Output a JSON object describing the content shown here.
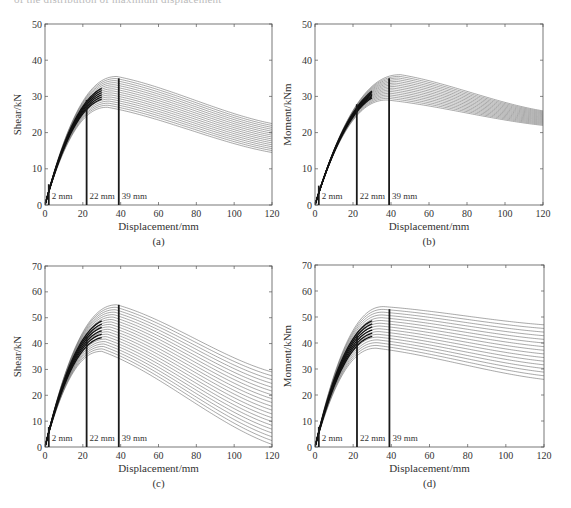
{
  "page": {
    "cut_off_caption": "of the distribution of maximum displacement"
  },
  "markers": {
    "positions": [
      2,
      22,
      39
    ],
    "labels": [
      "2 mm",
      "22 mm",
      "39 mm"
    ]
  },
  "chart_data": [
    {
      "id": "a",
      "type": "line",
      "subtype": "contour",
      "panel_label": "(a)",
      "title": "",
      "xlabel": "Displacement/mm",
      "ylabel": "Shear/kN",
      "xlim": [
        0,
        120
      ],
      "ylim": [
        0,
        50
      ],
      "xticks": [
        0,
        20,
        40,
        60,
        80,
        100,
        120
      ],
      "yticks": [
        0,
        10,
        20,
        30,
        40,
        50
      ],
      "grid": false,
      "legend": null,
      "vertical_markers": [
        {
          "x": 2,
          "label": "2 mm"
        },
        {
          "x": 22,
          "label": "22 mm"
        },
        {
          "x": 39,
          "label": "39 mm",
          "top": 35
        }
      ],
      "contour_band": {
        "peak_x": [
          33,
          38
        ],
        "peak_y": [
          27,
          35.5
        ],
        "end_y_at_120": [
          14.5,
          22.5
        ],
        "levels": 16
      }
    },
    {
      "id": "b",
      "type": "line",
      "subtype": "contour",
      "panel_label": "(b)",
      "title": "",
      "xlabel": "Displacement/mm",
      "ylabel": "Moment/kNm",
      "xlim": [
        0,
        120
      ],
      "ylim": [
        0,
        50
      ],
      "xticks": [
        0,
        20,
        40,
        60,
        80,
        100,
        120
      ],
      "yticks": [
        0,
        10,
        20,
        30,
        40,
        50
      ],
      "grid": false,
      "legend": null,
      "vertical_markers": [
        {
          "x": 2,
          "label": "2 mm"
        },
        {
          "x": 22,
          "label": "22 mm"
        },
        {
          "x": 39,
          "label": "39 mm",
          "top": 35
        }
      ],
      "contour_band": {
        "peak_x": [
          38,
          45
        ],
        "peak_y": [
          29,
          36
        ],
        "end_y_at_120": [
          22,
          26
        ],
        "levels": 16
      }
    },
    {
      "id": "c",
      "type": "line",
      "subtype": "contour",
      "panel_label": "(c)",
      "title": "",
      "xlabel": "Displacement/mm",
      "ylabel": "Shear/kN",
      "xlim": [
        0,
        120
      ],
      "ylim": [
        0,
        70
      ],
      "xticks": [
        0,
        20,
        40,
        60,
        80,
        100,
        120
      ],
      "yticks": [
        0,
        10,
        20,
        30,
        40,
        50,
        60,
        70
      ],
      "grid": false,
      "legend": null,
      "vertical_markers": [
        {
          "x": 2,
          "label": "2 mm"
        },
        {
          "x": 22,
          "label": "22 mm"
        },
        {
          "x": 39,
          "label": "39 mm",
          "top": 55
        }
      ],
      "contour_band": {
        "peak_x": [
          30,
          38
        ],
        "peak_y": [
          37,
          55
        ],
        "end_y_at_120": [
          1,
          29
        ],
        "levels": 20
      }
    },
    {
      "id": "d",
      "type": "line",
      "subtype": "contour",
      "panel_label": "(d)",
      "title": "",
      "xlabel": "Displacement/mm",
      "ylabel": "Moment/kNm",
      "xlim": [
        0,
        120
      ],
      "ylim": [
        0,
        70
      ],
      "xticks": [
        0,
        20,
        40,
        60,
        80,
        100,
        120
      ],
      "yticks": [
        0,
        10,
        20,
        30,
        40,
        50,
        60,
        70
      ],
      "grid": false,
      "legend": null,
      "vertical_markers": [
        {
          "x": 2,
          "label": "2 mm"
        },
        {
          "x": 22,
          "label": "22 mm"
        },
        {
          "x": 39,
          "label": "39 mm",
          "top": 53
        }
      ],
      "contour_band": {
        "peak_x": [
          32,
          36
        ],
        "peak_y": [
          38,
          54
        ],
        "end_y_at_120": [
          26,
          47
        ],
        "levels": 16
      }
    }
  ],
  "layout": {
    "panels": [
      {
        "left": 45,
        "top": 24,
        "width": 227,
        "height": 181
      },
      {
        "left": 315,
        "top": 24,
        "width": 228,
        "height": 181
      },
      {
        "left": 45,
        "top": 266,
        "width": 227,
        "height": 181
      },
      {
        "left": 315,
        "top": 265,
        "width": 229,
        "height": 182
      }
    ],
    "line_color": "#555555",
    "marker_color": "#1a1a1a"
  }
}
